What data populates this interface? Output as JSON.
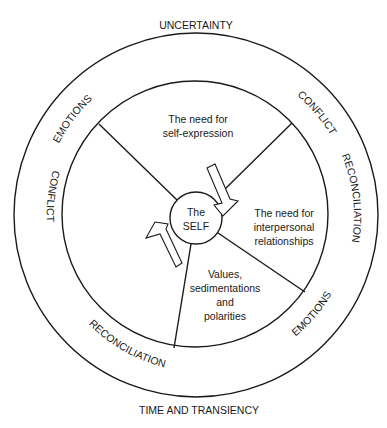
{
  "diagram": {
    "outer_labels": {
      "top": "UNCERTAINTY",
      "bottom": "TIME AND TRANSIENCY"
    },
    "ring_labels": [
      {
        "id": "emotions_top_left",
        "text": "EMOTIONS"
      },
      {
        "id": "conflict_top_right",
        "text": "CONFLICT"
      },
      {
        "id": "reconciliation_right",
        "text": "RECONCILIATION"
      },
      {
        "id": "emotions_bottom_right",
        "text": "EMOTIONS"
      },
      {
        "id": "reconciliation_bottom",
        "text": "RECONCILIATION"
      },
      {
        "id": "conflict_left",
        "text": "CONFLICT"
      }
    ],
    "sectors": {
      "top": [
        "The need for",
        "self-expression"
      ],
      "right": [
        "The need for",
        "interpersonal",
        "relationships"
      ],
      "bottom": [
        "Values,",
        "sedimentations",
        "and",
        "polarities"
      ]
    },
    "center": {
      "lines": [
        "The",
        "SELF"
      ]
    },
    "arrows": [
      {
        "id": "arrow-inward",
        "direction": "toward-self"
      },
      {
        "id": "arrow-outward",
        "direction": "away-from-self"
      }
    ],
    "colors": {
      "stroke": "#1a1a1a",
      "background": "#ffffff"
    }
  }
}
